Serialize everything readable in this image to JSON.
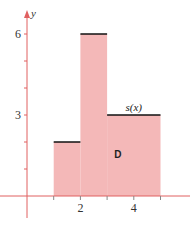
{
  "chart_data": {
    "type": "area",
    "title": "",
    "xlabel": "",
    "ylabel": "y",
    "function_label": "s(x)",
    "region_label": "D",
    "steps": [
      {
        "x_start": 1,
        "x_end": 2,
        "y": 2
      },
      {
        "x_start": 2,
        "x_end": 3,
        "y": 6
      },
      {
        "x_start": 3,
        "x_end": 5,
        "y": 3
      }
    ],
    "x_ticks": [
      1,
      2,
      3,
      4,
      5
    ],
    "x_tick_labels": [
      "",
      "2",
      "",
      "4",
      ""
    ],
    "y_ticks": [
      1,
      2,
      3,
      4,
      5,
      6
    ],
    "y_tick_labels": [
      "",
      "",
      "3",
      "",
      "",
      "6"
    ],
    "xlim": [
      -0.4,
      6
    ],
    "ylim": [
      -0.8,
      6.8
    ],
    "grid": false,
    "colors": {
      "fill": "#f4b8b8",
      "axis": "#e06060",
      "step_line": "#111111"
    }
  }
}
